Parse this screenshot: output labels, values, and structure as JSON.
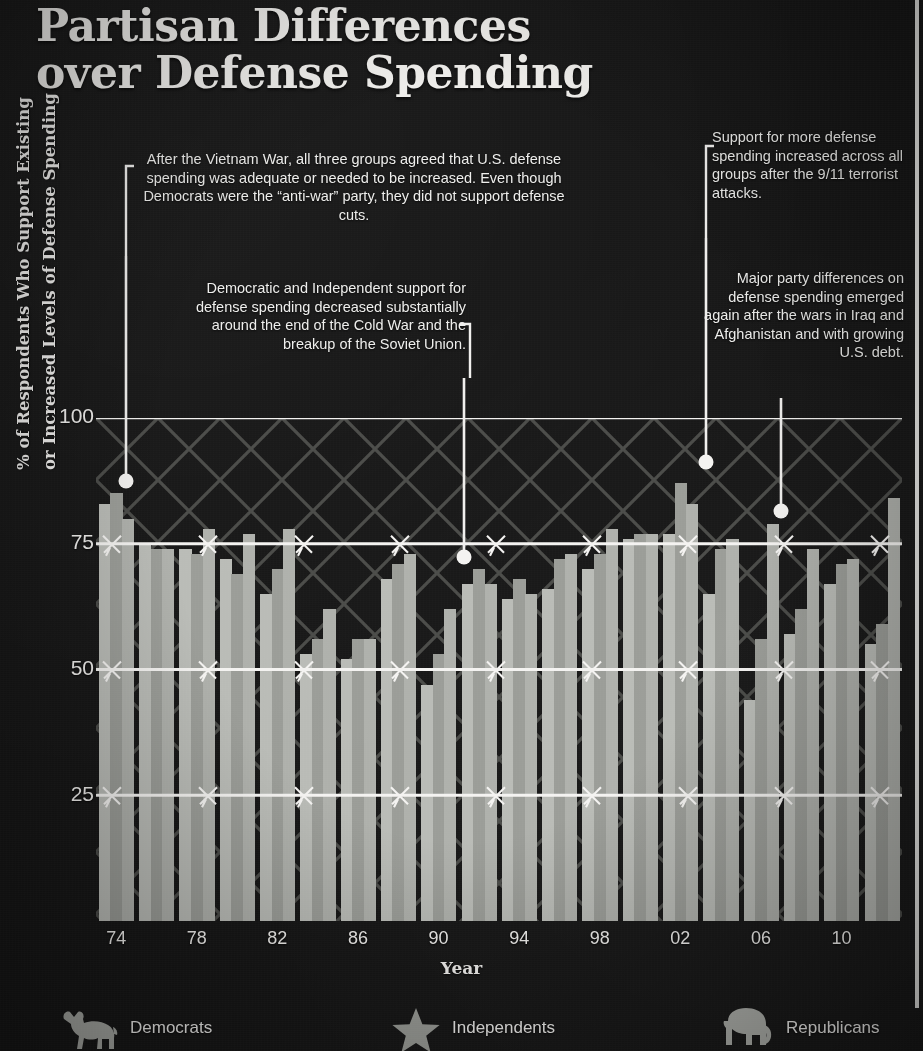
{
  "title": {
    "line1": "Partisan Differences",
    "line2": "over Defense Spending"
  },
  "annotations": [
    {
      "id": "vietnam",
      "text": "After the Vietnam War, all three groups agreed that U.S. defense spending was adequate or needed to be increased. Even though Democrats were the “anti-war” party, they did not support defense cuts."
    },
    {
      "id": "cold-war",
      "text": "Democratic and Independent support for defense spending decreased substantially around the end of the Cold War and the breakup of the Soviet Union."
    },
    {
      "id": "sept-eleven",
      "text": "Support for more defense spending increased across all groups after the 9/11 terrorist attacks."
    },
    {
      "id": "iraq-afghanistan",
      "text": "Major party differences on defense spending emerged again after the wars in Iraq and Afghanistan and with growing U.S. debt."
    }
  ],
  "axes": {
    "ylabel_line1": "% of Respondents Who Support Existing",
    "ylabel_line2": "or Increased Levels of Defense Spending",
    "xlabel": "Year",
    "yticks": [
      "100",
      "75",
      "50",
      "25"
    ],
    "xticks": [
      "74",
      "78",
      "82",
      "86",
      "90",
      "94",
      "98",
      "02",
      "06",
      "10"
    ]
  },
  "legend": {
    "items": [
      {
        "label": "Democrats",
        "icon": "donkey-icon",
        "color": "#b9bbb6"
      },
      {
        "label": "Independents",
        "icon": "star-icon",
        "color": "#9a9c97"
      },
      {
        "label": "Republicans",
        "icon": "elephant-icon",
        "color": "#aeb0ab"
      }
    ]
  },
  "chart_data": {
    "type": "bar",
    "title": "Partisan Differences over Defense Spending",
    "xlabel": "Year",
    "ylabel": "% of Respondents Who Support Existing or Increased Levels of Defense Spending",
    "ylim": [
      0,
      100
    ],
    "yticks": [
      25,
      50,
      75,
      100
    ],
    "grid": true,
    "legend_position": "bottom",
    "categories": [
      "1974",
      "1976",
      "1978",
      "1980",
      "1982",
      "1984",
      "1986",
      "1988",
      "1990",
      "1992",
      "1994",
      "1996",
      "1998",
      "2000",
      "2002",
      "2004",
      "2006",
      "2008",
      "2010",
      "2012"
    ],
    "xtick_labels": [
      "74",
      "78",
      "82",
      "86",
      "90",
      "94",
      "98",
      "02",
      "06",
      "10"
    ],
    "series": [
      {
        "name": "Democrats",
        "color": "#b9bbb6",
        "values": [
          83,
          75,
          74,
          72,
          65,
          53,
          52,
          68,
          47,
          67,
          64,
          66,
          70,
          76,
          77,
          65,
          44,
          57,
          67,
          55
        ]
      },
      {
        "name": "Independents",
        "color": "#9a9c97",
        "values": [
          85,
          74,
          73,
          69,
          70,
          56,
          56,
          71,
          53,
          70,
          68,
          72,
          73,
          77,
          87,
          74,
          56,
          62,
          71,
          59
        ]
      },
      {
        "name": "Republicans",
        "color": "#aeb0ab",
        "values": [
          80,
          74,
          78,
          77,
          78,
          62,
          56,
          73,
          62,
          67,
          65,
          73,
          78,
          77,
          83,
          76,
          79,
          74,
          72,
          84
        ]
      }
    ]
  }
}
